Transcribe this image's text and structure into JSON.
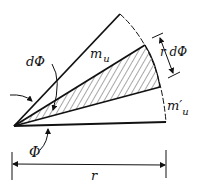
{
  "diagram": {
    "labels": {
      "d_phi": "dΦ",
      "m_u": "m",
      "m_u_sub": "u",
      "r_d_phi": "r dΦ",
      "m_prime_u": "m′",
      "m_prime_u_sub": "u",
      "phi": "Φ",
      "r": "r"
    },
    "colors": {
      "stroke": "#111111",
      "background": "#ffffff"
    }
  }
}
